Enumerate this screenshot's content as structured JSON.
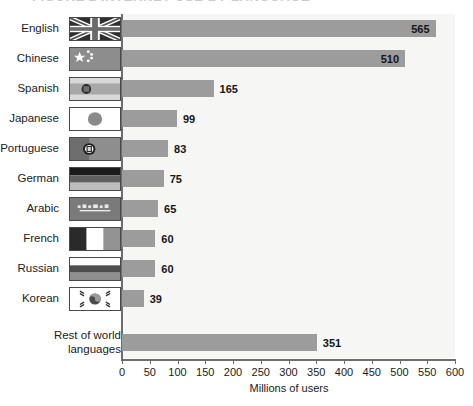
{
  "figure": {
    "title_fragment": "FIGURE 2   INTERNET USE BY LANGUAGE",
    "title_visible": "clipped"
  },
  "chart_data": {
    "type": "bar",
    "orientation": "horizontal",
    "title": "FIGURE 2   INTERNET USE BY LANGUAGE",
    "xlabel": "Millions of users",
    "ylabel": "",
    "xlim": [
      0,
      600
    ],
    "xticks": [
      0,
      50,
      100,
      150,
      200,
      250,
      300,
      350,
      400,
      450,
      500,
      550,
      600
    ],
    "grid": false,
    "legend": "none",
    "bar_color": "#9c9c9c",
    "plot_background": "#f6f6f4",
    "categories": [
      "English",
      "Chinese",
      "Spanish",
      "Japanese",
      "Portuguese",
      "German",
      "Arabic",
      "French",
      "Russian",
      "Korean",
      "Rest of world languages"
    ],
    "values": [
      565,
      510,
      165,
      99,
      83,
      75,
      65,
      60,
      60,
      39,
      351
    ],
    "value_labels": [
      "565",
      "510",
      "165",
      "99",
      "83",
      "75",
      "65",
      "60",
      "60",
      "39",
      "351"
    ],
    "flags": [
      "flag-united-kingdom",
      "flag-china",
      "flag-spain",
      "flag-japan",
      "flag-portugal",
      "flag-germany",
      "flag-saudi-arabia",
      "flag-france",
      "flag-russia",
      "flag-south-korea",
      "flag-none"
    ]
  },
  "rows": [
    {
      "label": "English",
      "value": "565",
      "flag": "flag-united-kingdom"
    },
    {
      "label": "Chinese",
      "value": "510",
      "flag": "flag-china"
    },
    {
      "label": "Spanish",
      "value": "165",
      "flag": "flag-spain"
    },
    {
      "label": "Japanese",
      "value": "99",
      "flag": "flag-japan"
    },
    {
      "label": "Portuguese",
      "value": "83",
      "flag": "flag-portugal"
    },
    {
      "label": "German",
      "value": "75",
      "flag": "flag-germany"
    },
    {
      "label": "Arabic",
      "value": "65",
      "flag": "flag-saudi-arabia"
    },
    {
      "label": "French",
      "value": "60",
      "flag": "flag-france"
    },
    {
      "label": "Russian",
      "value": "60",
      "flag": "flag-russia"
    },
    {
      "label": "Korean",
      "value": "39",
      "flag": "flag-south-korea"
    },
    {
      "label": "Rest of world languages",
      "value": "351",
      "flag": "flag-none"
    }
  ],
  "axis": {
    "title": "Millions of users",
    "ticks": [
      "0",
      "50",
      "100",
      "150",
      "200",
      "250",
      "300",
      "350",
      "400",
      "450",
      "500",
      "550",
      "600"
    ]
  }
}
